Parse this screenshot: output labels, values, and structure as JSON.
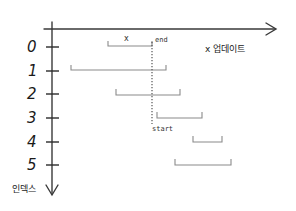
{
  "diagram": {
    "title": "",
    "x_axis_label": "x 업데이트",
    "y_axis_label": "인덱스",
    "marker_label": "x",
    "end_label": "end",
    "start_label": "start",
    "index_labels": [
      "0",
      "1",
      "2",
      "3",
      "4",
      "5"
    ],
    "rows": [
      {
        "index": "0",
        "x_start": 108,
        "x_end": 152,
        "y": 47
      },
      {
        "index": "1",
        "x_start": 71,
        "x_end": 166,
        "y": 71
      },
      {
        "index": "2",
        "x_start": 116,
        "x_end": 180,
        "y": 95
      },
      {
        "index": "3",
        "x_start": 157,
        "x_end": 202,
        "y": 118
      },
      {
        "index": "4",
        "x_start": 193,
        "x_end": 222,
        "y": 142
      },
      {
        "index": "5",
        "x_start": 175,
        "x_end": 231,
        "y": 165
      }
    ],
    "divider_x": 152,
    "colors": {
      "axis": "#3a3a3a",
      "bracket": "#8a8a8a",
      "text": "#1a1a1a"
    }
  }
}
